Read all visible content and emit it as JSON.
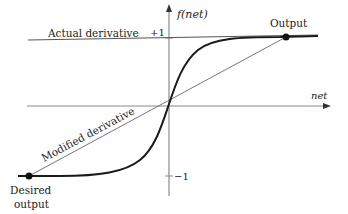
{
  "diagram": {
    "y_axis_label": "f(net)",
    "x_axis_label": "net",
    "plus_one": "+1",
    "minus_one": "−1",
    "actual_derivative": "Actual derivative",
    "modified_derivative": "Modified derivative",
    "output": "Output",
    "desired_output_line1": "Desired",
    "desired_output_line2": "output"
  },
  "colors": {
    "axis": "#8a8a8a",
    "curve": "#1a1a1a",
    "line": "#555555",
    "text": "#222222"
  }
}
